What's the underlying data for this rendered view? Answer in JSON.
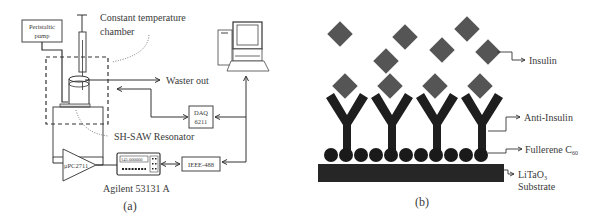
{
  "panel_a": {
    "caption": "(a)",
    "labels": {
      "pump_line1": "Peristaltic",
      "pump_line2": "pump",
      "chamber_line1": "Constant temperature",
      "chamber_line2": "chamber",
      "waste": "Waster out",
      "daq_line1": "DAQ",
      "daq_line2": "6211",
      "resonator": "SH-SAW Resonator",
      "amplifier": "μPC2711",
      "counter_display": "145.000000",
      "ieee": "IEEE-488",
      "counter_name": "Agilent 53131 A"
    },
    "components": [
      {
        "name": "peristaltic-pump",
        "type": "box"
      },
      {
        "name": "syringe",
        "type": "vertical-tube"
      },
      {
        "name": "flow-cell",
        "type": "cylinder"
      },
      {
        "name": "constant-temperature-chamber",
        "type": "dashed-box"
      },
      {
        "name": "sh-saw-resonator",
        "type": "plate"
      },
      {
        "name": "amplifier",
        "type": "triangle"
      },
      {
        "name": "frequency-counter",
        "type": "instrument"
      },
      {
        "name": "ieee-488-interface",
        "type": "box"
      },
      {
        "name": "daq-6211",
        "type": "box"
      },
      {
        "name": "computer",
        "type": "pc-icon"
      }
    ]
  },
  "panel_b": {
    "caption": "(b)",
    "labels": {
      "insulin": "Insulin",
      "anti_insulin": "Anti-Insulin",
      "fullerene": "Fullerene C",
      "fullerene_sub": "60",
      "substrate_line1": "LiTaO",
      "substrate_sub": "3",
      "substrate_line2": "Substrate"
    },
    "counts": {
      "free_insulin_diamonds": 6,
      "bound_insulin_diamonds": 4,
      "antibodies": 4,
      "fullerene_spheres": 11
    },
    "colors": {
      "insulin": "#555555",
      "antibody": "#1e1e1e",
      "fullerene": "#1a1a1a",
      "substrate": "#262626"
    }
  }
}
